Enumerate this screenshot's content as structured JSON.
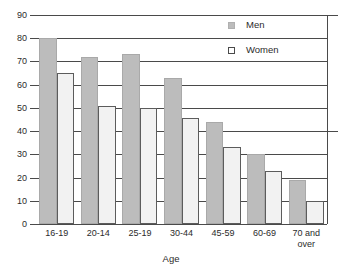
{
  "chart_data": {
    "type": "bar",
    "title": "",
    "xlabel": "Age",
    "ylabel": "",
    "categories": [
      "16-19",
      "20-14",
      "25-19",
      "30-44",
      "45-59",
      "60-69",
      "70 and\nover"
    ],
    "series": [
      {
        "name": "Men",
        "color": "#bcbcbc",
        "values": [
          80,
          72,
          73,
          63,
          44,
          30,
          19
        ]
      },
      {
        "name": "Women",
        "color": "#f2f2f2",
        "values": [
          65,
          51,
          50,
          45.5,
          33,
          23,
          10
        ]
      }
    ],
    "ylim": [
      0,
      90
    ],
    "ytick_step": 10,
    "yticks": [
      0,
      10,
      20,
      30,
      40,
      50,
      60,
      70,
      80,
      90
    ],
    "ytick_labels": [
      "0",
      "10",
      "20",
      "30",
      "40",
      "50",
      "60",
      "70",
      "80",
      "90"
    ],
    "grid": true,
    "grid_axis": "y",
    "legend_position": "top-right"
  },
  "axis": {
    "x_title": "Age"
  },
  "legend": {
    "entries": [
      {
        "label": "Men",
        "swatch": "filled-gray-square"
      },
      {
        "label": "Women",
        "swatch": "outlined-white-square"
      }
    ]
  }
}
